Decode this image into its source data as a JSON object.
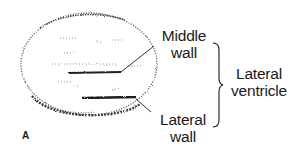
{
  "figure": {
    "panel_letter": "A",
    "structure": "ultrasound cross-section of lateral ventricle",
    "labels": {
      "middle_wall": {
        "line1": "Middle",
        "line2": "wall"
      },
      "lateral_wall": {
        "line1": "Lateral",
        "line2": "wall"
      },
      "group": {
        "line1": "Lateral",
        "line2": "ventricle"
      }
    },
    "colors": {
      "ink": "#1a1a1a",
      "stipple": "#555555",
      "background": "#ffffff"
    }
  }
}
